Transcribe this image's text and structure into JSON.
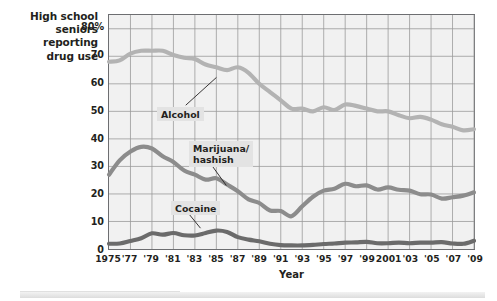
{
  "title": {
    "line1": "High school",
    "line2": "seniors",
    "line3": "reporting",
    "line4": "drug use"
  },
  "axes": {
    "x_title": "Year",
    "y_tick_labels": [
      "80%",
      "70",
      "60",
      "50",
      "40",
      "30",
      "20",
      "10",
      "0"
    ],
    "x_tick_labels": [
      "1975",
      "'77",
      "'79",
      "'81",
      "'83",
      "'85",
      "'87",
      "'89",
      "'91",
      "'93",
      "'95",
      "'97",
      "'99",
      "2001",
      "'03",
      "'05",
      "'07",
      "'09"
    ]
  },
  "annotations": [
    {
      "name": "alcohol-label",
      "text": "Alcohol"
    },
    {
      "name": "marijuana-label",
      "text": "Marijuana/\nhashish"
    },
    {
      "name": "cocaine-label",
      "text": "Cocaine"
    }
  ],
  "colors": {
    "plot_background": "#f1f1f1",
    "plot_border": "#6d6e71",
    "gridline": "#9a9a9a",
    "alcohol": "#b3b3b3",
    "marijuana": "#8c8c8c",
    "cocaine": "#6b6b6b",
    "text": "#231f20",
    "label_background": "#e3e3e3"
  },
  "chart_data": {
    "type": "line",
    "title": "High school seniors reporting drug use",
    "xlabel": "Year",
    "ylabel": "Percent reporting drug use",
    "xlim": [
      1975,
      2009
    ],
    "ylim": [
      0,
      85
    ],
    "y_ticks": [
      0,
      10,
      20,
      30,
      40,
      50,
      60,
      70,
      80
    ],
    "x_ticks": [
      1975,
      1977,
      1979,
      1981,
      1983,
      1985,
      1987,
      1989,
      1991,
      1993,
      1995,
      1997,
      1999,
      2001,
      2003,
      2005,
      2007,
      2009
    ],
    "grid": true,
    "legend": "inline-labels",
    "x": [
      1975,
      1976,
      1977,
      1978,
      1979,
      1980,
      1981,
      1982,
      1983,
      1984,
      1985,
      1986,
      1987,
      1988,
      1989,
      1990,
      1991,
      1992,
      1993,
      1994,
      1995,
      1996,
      1997,
      1998,
      1999,
      2000,
      2001,
      2002,
      2003,
      2004,
      2005,
      2006,
      2007,
      2008,
      2009
    ],
    "series": [
      {
        "name": "Alcohol",
        "color": "#b3b3b3",
        "values": [
          68,
          68.5,
          71,
          72,
          72,
          72,
          70.5,
          69.5,
          69,
          67,
          66,
          65,
          66,
          64,
          60,
          57,
          54,
          51,
          51,
          50,
          51.5,
          50.5,
          52.5,
          52,
          51,
          50,
          50,
          48.6,
          47.5,
          48,
          47,
          45.3,
          44.4,
          43.1,
          43.5
        ]
      },
      {
        "name": "Marijuana/hashish",
        "color": "#8c8c8c",
        "values": [
          27,
          32.2,
          35.4,
          37.1,
          36.5,
          33.7,
          31.6,
          28.5,
          27,
          25.2,
          25.7,
          23.4,
          21,
          18,
          16.7,
          14,
          13.8,
          11.9,
          15.5,
          19,
          21.2,
          21.9,
          23.7,
          22.8,
          23.1,
          21.6,
          22.4,
          21.5,
          21.2,
          19.9,
          19.8,
          18.3,
          18.8,
          19.4,
          20.6
        ]
      },
      {
        "name": "Cocaine",
        "color": "#6b6b6b",
        "values": [
          1.9,
          2.0,
          2.9,
          3.9,
          5.7,
          5.2,
          5.8,
          5.0,
          4.9,
          5.8,
          6.7,
          6.2,
          4.3,
          3.4,
          2.8,
          1.9,
          1.4,
          1.3,
          1.3,
          1.5,
          1.8,
          2.0,
          2.3,
          2.4,
          2.6,
          2.1,
          2.1,
          2.3,
          2.1,
          2.3,
          2.3,
          2.5,
          2.0,
          1.9,
          3.0
        ]
      }
    ]
  }
}
